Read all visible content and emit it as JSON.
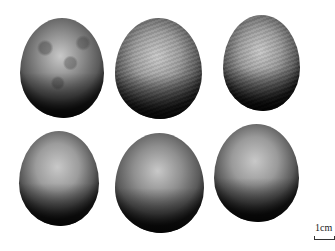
{
  "image": {
    "description": "Six grayscale seeds arranged in two rows of three on white background",
    "background": "#ffffff"
  },
  "seeds": [
    {
      "id": 1,
      "row": 1,
      "col": 1,
      "x": 20,
      "y": 18,
      "w": 84,
      "h": 100,
      "tone": "#8a8a8a",
      "dark": "#1e1e1e",
      "texture": "mottled"
    },
    {
      "id": 2,
      "row": 1,
      "col": 2,
      "x": 115,
      "y": 18,
      "w": 87,
      "h": 101,
      "tone": "#9a9a9a",
      "dark": "#202020",
      "texture": "streaked"
    },
    {
      "id": 3,
      "row": 1,
      "col": 3,
      "x": 223,
      "y": 15,
      "w": 77,
      "h": 96,
      "tone": "#999999",
      "dark": "#1a1a1a",
      "texture": "streaked"
    },
    {
      "id": 4,
      "row": 2,
      "col": 1,
      "x": 19,
      "y": 131,
      "w": 80,
      "h": 95,
      "tone": "#9c9c9c",
      "dark": "#1c1c1c",
      "texture": "smooth"
    },
    {
      "id": 5,
      "row": 2,
      "col": 2,
      "x": 115,
      "y": 133,
      "w": 89,
      "h": 100,
      "tone": "#8f8f8f",
      "dark": "#1a1a1a",
      "texture": "smooth"
    },
    {
      "id": 6,
      "row": 2,
      "col": 3,
      "x": 214,
      "y": 124,
      "w": 85,
      "h": 98,
      "tone": "#9a9a9a",
      "dark": "#1a1a1a",
      "texture": "smooth"
    }
  ],
  "scale_bar": {
    "label": "1cm"
  }
}
